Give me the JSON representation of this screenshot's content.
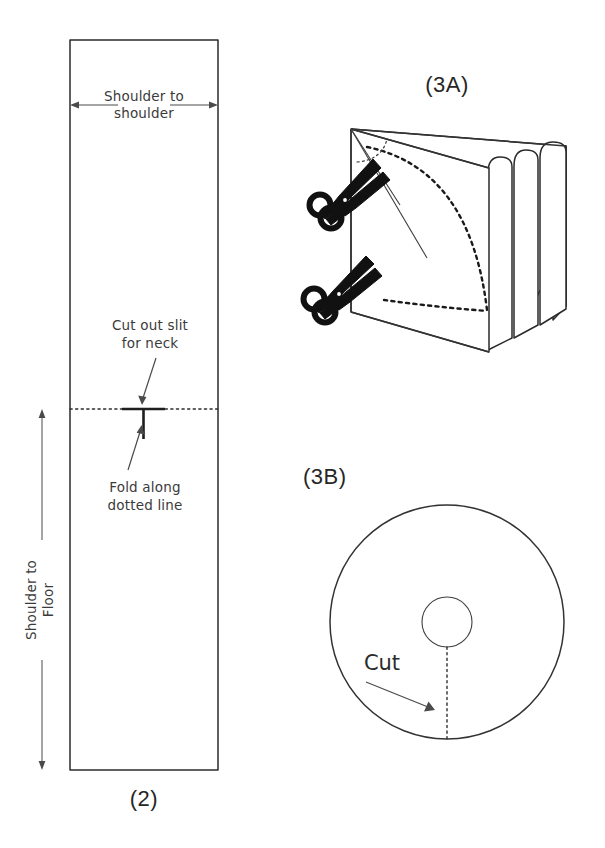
{
  "document": {
    "title": "Poncho cutting pattern instructions",
    "background_color": "#ffffff",
    "ink_color": "#333333"
  },
  "panels": [
    {
      "id": "panel-2",
      "label": "(2)",
      "description": "Rectangular fabric panel with fold line and neck slit",
      "labels": {
        "width_dimension": "Shoulder to\nshoulder",
        "width_dimension_line1": "Shoulder to",
        "width_dimension_line2": "shoulder",
        "height_dimension_line1": "Shoulder to",
        "height_dimension_line2": "Floor",
        "neck_note_line1": "Cut out slit",
        "neck_note_line2": "for neck",
        "fold_note_line1": "Fold along",
        "fold_note_line2": "dotted line"
      }
    },
    {
      "id": "panel-3a",
      "label": "(3A)",
      "description": "Folded fabric stack being cut along a dotted arc with scissors"
    },
    {
      "id": "panel-3b",
      "label": "(3B)",
      "description": "Circular poncho with centre neck hole and dotted cut line",
      "labels": {
        "cut_note": "Cut"
      }
    }
  ],
  "geometry": {
    "rectangle": {
      "x": 70,
      "y": 40,
      "width": 148,
      "height": 730
    },
    "fold_line_y": 409,
    "circle": {
      "cx": 447,
      "cy": 622,
      "r_outer": 117,
      "r_neck": 25
    }
  },
  "colors": {
    "paper": "#ffffff",
    "line": "#333333",
    "label_text": "#3b3b3b",
    "panel_label_text": "#262626",
    "scissors": "#111111"
  }
}
